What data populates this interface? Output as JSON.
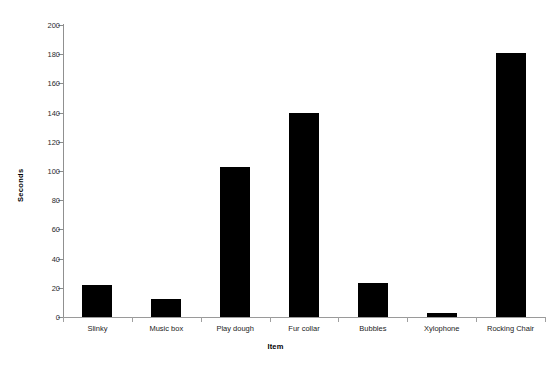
{
  "chart_data": {
    "type": "bar",
    "title": "",
    "xlabel": "Item",
    "ylabel": "Seconds",
    "categories": [
      "Slinky",
      "Music box",
      "Play dough",
      "Fur collar",
      "Bubbles",
      "Xylophone",
      "Rocking Chair"
    ],
    "values": [
      22,
      12,
      103,
      140,
      23,
      3,
      181
    ],
    "ylim": [
      0,
      200
    ],
    "ytick_step": 20,
    "ytick_labels": [
      "0",
      "20",
      "40",
      "60",
      "80",
      "100",
      "120",
      "140",
      "160",
      "180",
      "200"
    ],
    "grid": false,
    "legend": null,
    "bar_color": "#000000",
    "axis_color": "#909090",
    "background": "#ffffff"
  }
}
